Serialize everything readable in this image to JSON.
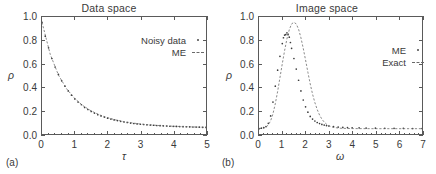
{
  "figure": {
    "panel_a_tag": "(a)",
    "panel_b_tag": "(b)"
  },
  "panel_a": {
    "title": "Data space",
    "xlabel": "τ",
    "ylabel": "ρ",
    "xticks": [
      "0",
      "1",
      "2",
      "3",
      "4",
      "5"
    ],
    "yticks": [
      "0.0",
      "0.2",
      "0.4",
      "0.6",
      "0.8",
      "1.0"
    ],
    "legend": [
      {
        "label": "Noisy data",
        "key": "dot-marker"
      },
      {
        "label": "ME",
        "key": "dashed-line"
      }
    ]
  },
  "panel_b": {
    "title": "Image space",
    "xlabel": "ω",
    "ylabel": "ρ",
    "xticks": [
      "0",
      "1",
      "2",
      "3",
      "4",
      "5",
      "6",
      "7"
    ],
    "yticks": [
      "0.0",
      "0.2",
      "0.4",
      "0.6",
      "0.8",
      "1.0"
    ],
    "legend": [
      {
        "label": "ME",
        "key": "dot-marker"
      },
      {
        "label": "Exact",
        "key": "dashed-line"
      }
    ]
  },
  "chart_data": [
    {
      "type": "scatter",
      "title": "Data space",
      "xlabel": "τ",
      "ylabel": "ρ",
      "xlim": [
        0,
        5
      ],
      "ylim": [
        -0.05,
        1.05
      ],
      "grid": false,
      "legend_position": "upper-right",
      "series": [
        {
          "name": "Noisy data",
          "style": "dots",
          "x": [
            0.0,
            0.1,
            0.2,
            0.3,
            0.4,
            0.5,
            0.6,
            0.7,
            0.8,
            0.9,
            1.0,
            1.1,
            1.2,
            1.3,
            1.4,
            1.5,
            1.6,
            1.7,
            1.8,
            1.9,
            2.0,
            2.1,
            2.2,
            2.3,
            2.4,
            2.5,
            2.6,
            2.7,
            2.8,
            2.9,
            3.0,
            3.1,
            3.2,
            3.3,
            3.4,
            3.5,
            3.6,
            3.7,
            3.8,
            3.9,
            4.0,
            4.1,
            4.2,
            4.3,
            4.4,
            4.5,
            4.6,
            4.7,
            4.8,
            4.9,
            5.0
          ],
          "y": [
            1.0,
            0.87,
            0.76,
            0.66,
            0.58,
            0.51,
            0.45,
            0.4,
            0.355,
            0.315,
            0.28,
            0.25,
            0.225,
            0.2,
            0.18,
            0.162,
            0.146,
            0.132,
            0.12,
            0.109,
            0.099,
            0.09,
            0.082,
            0.075,
            0.069,
            0.063,
            0.058,
            0.053,
            0.049,
            0.045,
            0.042,
            0.039,
            0.036,
            0.034,
            0.032,
            0.03,
            0.028,
            0.026,
            0.025,
            0.023,
            0.022,
            0.021,
            0.02,
            0.019,
            0.018,
            0.017,
            0.016,
            0.015,
            0.014,
            0.013,
            0.012
          ]
        },
        {
          "name": "ME",
          "style": "dashed",
          "x": [
            0.0,
            0.25,
            0.5,
            0.75,
            1.0,
            1.25,
            1.5,
            1.75,
            2.0,
            2.25,
            2.5,
            2.75,
            3.0,
            3.25,
            3.5,
            3.75,
            4.0,
            4.25,
            4.5,
            4.75,
            5.0
          ],
          "y": [
            1.0,
            0.7,
            0.505,
            0.375,
            0.283,
            0.216,
            0.167,
            0.13,
            0.103,
            0.082,
            0.066,
            0.054,
            0.044,
            0.037,
            0.031,
            0.026,
            0.023,
            0.02,
            0.017,
            0.015,
            0.013
          ]
        }
      ]
    },
    {
      "type": "scatter",
      "title": "Image space",
      "xlabel": "ω",
      "ylabel": "ρ",
      "xlim": [
        0,
        7
      ],
      "ylim": [
        -0.05,
        1.05
      ],
      "grid": false,
      "legend_position": "upper-right",
      "series": [
        {
          "name": "ME",
          "style": "dots",
          "x": [
            0.0,
            0.1,
            0.2,
            0.3,
            0.4,
            0.5,
            0.6,
            0.7,
            0.8,
            0.9,
            1.0,
            1.05,
            1.1,
            1.15,
            1.2,
            1.25,
            1.3,
            1.35,
            1.4,
            1.5,
            1.6,
            1.7,
            1.8,
            1.9,
            2.0,
            2.1,
            2.2,
            2.3,
            2.4,
            2.5,
            2.6,
            2.7,
            2.8,
            2.9,
            3.0,
            3.2,
            3.4,
            3.6,
            3.8,
            4.0,
            4.3,
            4.6,
            5.0,
            5.4,
            5.8,
            6.2,
            6.6,
            7.0
          ],
          "y": [
            0.0,
            0.005,
            0.01,
            0.02,
            0.05,
            0.12,
            0.25,
            0.4,
            0.55,
            0.68,
            0.8,
            0.855,
            0.88,
            0.885,
            0.9,
            0.885,
            0.86,
            0.81,
            0.755,
            0.66,
            0.56,
            0.455,
            0.355,
            0.27,
            0.205,
            0.155,
            0.115,
            0.09,
            0.072,
            0.058,
            0.048,
            0.04,
            0.034,
            0.029,
            0.025,
            0.019,
            0.015,
            0.012,
            0.01,
            0.009,
            0.007,
            0.006,
            0.005,
            0.004,
            0.003,
            0.003,
            0.002,
            0.002
          ]
        },
        {
          "name": "Exact",
          "style": "dashed",
          "x": [
            0.0,
            0.2,
            0.3,
            0.4,
            0.5,
            0.6,
            0.7,
            0.8,
            0.9,
            1.0,
            1.1,
            1.2,
            1.3,
            1.4,
            1.5,
            1.6,
            1.7,
            1.8,
            1.9,
            2.0,
            2.1,
            2.2,
            2.3,
            2.4,
            2.5,
            2.6,
            2.7,
            2.8,
            2.9,
            3.0,
            3.1,
            3.2,
            3.4,
            3.6,
            4.0,
            5.0,
            6.0,
            7.0
          ],
          "y": [
            0.0,
            0.005,
            0.015,
            0.035,
            0.075,
            0.14,
            0.235,
            0.35,
            0.48,
            0.61,
            0.735,
            0.845,
            0.93,
            0.985,
            1.0,
            0.985,
            0.935,
            0.855,
            0.755,
            0.645,
            0.53,
            0.42,
            0.325,
            0.245,
            0.18,
            0.128,
            0.09,
            0.062,
            0.042,
            0.028,
            0.019,
            0.013,
            0.006,
            0.003,
            0.001,
            0.0,
            0.0,
            0.0
          ]
        }
      ]
    }
  ]
}
